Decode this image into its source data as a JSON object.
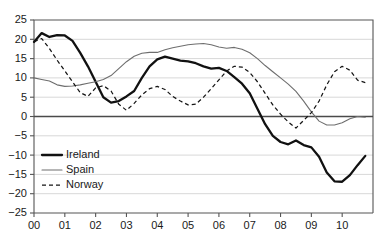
{
  "chart_data": {
    "type": "line",
    "title": "",
    "subtitle": "",
    "xlabel": "",
    "ylabel": "",
    "xlim": [
      0,
      11
    ],
    "ylim": [
      -25,
      25
    ],
    "grid": true,
    "grid_axis": "y",
    "legend_position": "bottom-left",
    "x_tick_labels": [
      "00",
      "01",
      "02",
      "03",
      "04",
      "05",
      "06",
      "07",
      "08",
      "09",
      "10"
    ],
    "x_tick_values": [
      0,
      1,
      2,
      3,
      4,
      5,
      6,
      7,
      8,
      9,
      10
    ],
    "y_tick_labels": [
      "25",
      "20",
      "15",
      "10",
      "5",
      "0",
      "−5",
      "−10",
      "−15",
      "−20",
      "−25"
    ],
    "y_tick_values": [
      25,
      20,
      15,
      10,
      5,
      0,
      -5,
      -10,
      -15,
      -20,
      -25
    ],
    "zero_line": 0,
    "series": [
      {
        "name": "Ireland",
        "style": "solid-thick",
        "color": "#111111",
        "x": [
          0.0,
          0.25,
          0.5,
          0.75,
          1.0,
          1.25,
          1.5,
          1.75,
          2.0,
          2.25,
          2.5,
          2.75,
          3.0,
          3.25,
          3.5,
          3.75,
          4.0,
          4.25,
          4.5,
          4.75,
          5.0,
          5.25,
          5.5,
          5.75,
          6.0,
          6.25,
          6.5,
          6.75,
          7.0,
          7.25,
          7.5,
          7.75,
          8.0,
          8.25,
          8.5,
          8.75,
          9.0,
          9.25,
          9.5,
          9.75,
          10.0,
          10.25,
          10.5,
          10.75
        ],
        "y": [
          19.3,
          21.6,
          20.6,
          21.1,
          21.0,
          19.6,
          16.5,
          13.0,
          9.0,
          5.0,
          3.6,
          4.0,
          5.2,
          6.6,
          10.0,
          13.0,
          14.8,
          15.5,
          15.0,
          14.5,
          14.3,
          13.8,
          13.0,
          12.4,
          12.6,
          11.8,
          10.2,
          8.5,
          6.0,
          2.0,
          -2.0,
          -5.0,
          -6.6,
          -7.2,
          -6.2,
          -7.4,
          -8.0,
          -10.4,
          -14.5,
          -16.8,
          -16.9,
          -15.2,
          -12.6,
          -10.2
        ]
      },
      {
        "name": "Spain",
        "style": "solid-thin",
        "color": "#6e6e6e",
        "x": [
          0.0,
          0.25,
          0.5,
          0.75,
          1.0,
          1.25,
          1.5,
          1.75,
          2.0,
          2.25,
          2.5,
          2.75,
          3.0,
          3.25,
          3.5,
          3.75,
          4.0,
          4.25,
          4.5,
          4.75,
          5.0,
          5.25,
          5.5,
          5.75,
          6.0,
          6.25,
          6.5,
          6.75,
          7.0,
          7.25,
          7.5,
          7.75,
          8.0,
          8.25,
          8.5,
          8.75,
          9.0,
          9.25,
          9.5,
          9.75,
          10.0,
          10.25,
          10.5,
          10.75
        ],
        "y": [
          10.0,
          9.6,
          9.2,
          8.2,
          7.8,
          7.9,
          8.2,
          8.6,
          9.0,
          9.6,
          10.6,
          12.4,
          14.2,
          15.6,
          16.4,
          16.6,
          16.6,
          17.3,
          17.8,
          18.2,
          18.6,
          18.8,
          18.9,
          18.6,
          18.0,
          17.7,
          17.9,
          17.4,
          16.5,
          15.0,
          13.2,
          11.6,
          10.0,
          8.4,
          6.5,
          4.0,
          1.2,
          -1.2,
          -2.2,
          -2.2,
          -1.6,
          -0.6,
          0.0,
          -0.2
        ]
      },
      {
        "name": "Norway",
        "style": "dashed",
        "color": "#151515",
        "x": [
          0.0,
          0.25,
          0.5,
          0.75,
          1.0,
          1.25,
          1.5,
          1.75,
          2.0,
          2.25,
          2.5,
          2.75,
          3.0,
          3.25,
          3.5,
          3.75,
          4.0,
          4.25,
          4.5,
          4.75,
          5.0,
          5.25,
          5.5,
          5.75,
          6.0,
          6.25,
          6.5,
          6.75,
          7.0,
          7.25,
          7.5,
          7.75,
          8.0,
          8.25,
          8.5,
          8.75,
          9.0,
          9.25,
          9.5,
          9.75,
          10.0,
          10.25,
          10.5,
          10.75
        ],
        "y": [
          19.4,
          20.2,
          17.6,
          14.6,
          11.8,
          9.0,
          6.2,
          5.2,
          7.4,
          8.0,
          6.6,
          3.2,
          1.6,
          3.4,
          5.6,
          7.2,
          7.8,
          7.0,
          5.2,
          4.0,
          3.0,
          3.2,
          5.0,
          7.2,
          9.5,
          11.8,
          13.0,
          12.8,
          11.4,
          9.0,
          6.0,
          3.0,
          0.6,
          -1.4,
          -3.0,
          -1.0,
          1.0,
          4.0,
          8.2,
          11.6,
          13.0,
          12.0,
          9.4,
          8.8
        ]
      }
    ],
    "legend": [
      {
        "label": "Ireland",
        "style": "solid-thick",
        "color": "#111111"
      },
      {
        "label": "Spain",
        "style": "solid-thin",
        "color": "#6e6e6e"
      },
      {
        "label": "Norway",
        "style": "dashed",
        "color": "#151515"
      }
    ]
  },
  "colors": {
    "background": "#ffffff",
    "gridline": "#d8d8d8",
    "axis": "#555555",
    "zero_line": "#4a4a4a",
    "ireland": "#111111",
    "spain": "#6e6e6e",
    "norway": "#151515"
  }
}
